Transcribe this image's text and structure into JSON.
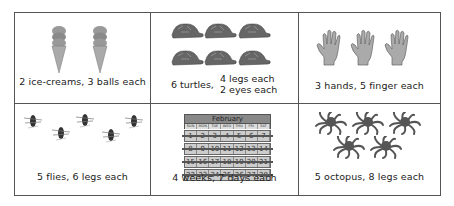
{
  "cells": [
    {
      "caption": "2 ice-creams, 3 balls each",
      "icon": "ice-cream",
      "count": 2
    },
    {
      "caption_left": "6 turtles,",
      "caption_right_1": "4 legs each",
      "caption_right_2": "2 eyes each",
      "icon": "turtle",
      "count": 6
    },
    {
      "caption": "3 hands, 5 finger each",
      "icon": "hand",
      "count": 3
    },
    {
      "caption": "5 flies, 6 legs each",
      "icon": "fly",
      "count": 5
    },
    {
      "caption": "4 weeks, 7 days each",
      "icon": "calendar",
      "count": 1
    },
    {
      "caption": "5 octopus, 8 legs each",
      "icon": "octopus",
      "count": 5
    }
  ],
  "calendar": {
    "month": "February",
    "days": [
      "SUN",
      "MON",
      "TUE",
      "WED",
      "THU",
      "FRI",
      "SAT"
    ],
    "weeks": [
      [
        "1",
        "2",
        "3",
        "4",
        "5",
        "6",
        "7"
      ],
      [
        "8",
        "9",
        "10",
        "11",
        "12",
        "13",
        "14"
      ],
      [
        "15",
        "16",
        "17",
        "18",
        "19",
        "20",
        "21"
      ],
      [
        "22",
        "23",
        "24",
        "25",
        "26",
        "27",
        "28"
      ]
    ]
  }
}
